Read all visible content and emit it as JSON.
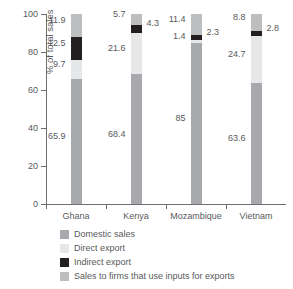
{
  "chart_data": {
    "type": "bar",
    "title": "",
    "subtitle": "",
    "xlabel": "",
    "ylabel": "% of total sales",
    "ylim": [
      0,
      100
    ],
    "yticks": [
      0,
      20,
      40,
      60,
      80,
      100
    ],
    "ytick_labels": [
      "0",
      "20",
      "40",
      "60",
      "80",
      "100"
    ],
    "grid": false,
    "stacked": true,
    "legend_position": "below",
    "categories": [
      "Ghana",
      "Kenya",
      "Mozambique",
      "Vietnam"
    ],
    "series": [
      {
        "name": "Domestic sales",
        "color": "#a7a9ac",
        "values": [
          65.9,
          68.4,
          85,
          63.6
        ],
        "labels": [
          "65.9",
          "68.4",
          "85",
          "63.6"
        ],
        "label_side": [
          "left",
          "left",
          "left",
          "left"
        ]
      },
      {
        "name": "Direct export",
        "color": "#e6e7e8",
        "values": [
          9.7,
          21.6,
          1.4,
          24.7
        ],
        "labels": [
          "9.7",
          "21.6",
          "1.4",
          "24.7"
        ],
        "label_side": [
          "left",
          "left",
          "left",
          "left"
        ]
      },
      {
        "name": "Indirect export",
        "color": "#231f20",
        "values": [
          12.5,
          4.3,
          2.3,
          2.8
        ],
        "labels": [
          "12.5",
          "4.3",
          "2.3",
          "2.8"
        ],
        "label_side": [
          "left",
          "right",
          "right",
          "right"
        ]
      },
      {
        "name": "Sales to firms that use inputs for exports",
        "color": "#bcbec0",
        "values": [
          11.9,
          5.7,
          11.4,
          8.8
        ],
        "labels": [
          "11.9",
          "5.7",
          "11.4",
          "8.8"
        ],
        "label_side": [
          "left",
          "left",
          "left",
          "left"
        ]
      }
    ]
  },
  "legend": {
    "items": [
      {
        "label": "Domestic sales",
        "color": "#a7a9ac"
      },
      {
        "label": "Direct export",
        "color": "#e6e7e8"
      },
      {
        "label": "Indirect export",
        "color": "#231f20"
      },
      {
        "label": "Sales to firms that use inputs for exports",
        "color": "#bcbec0"
      }
    ]
  }
}
